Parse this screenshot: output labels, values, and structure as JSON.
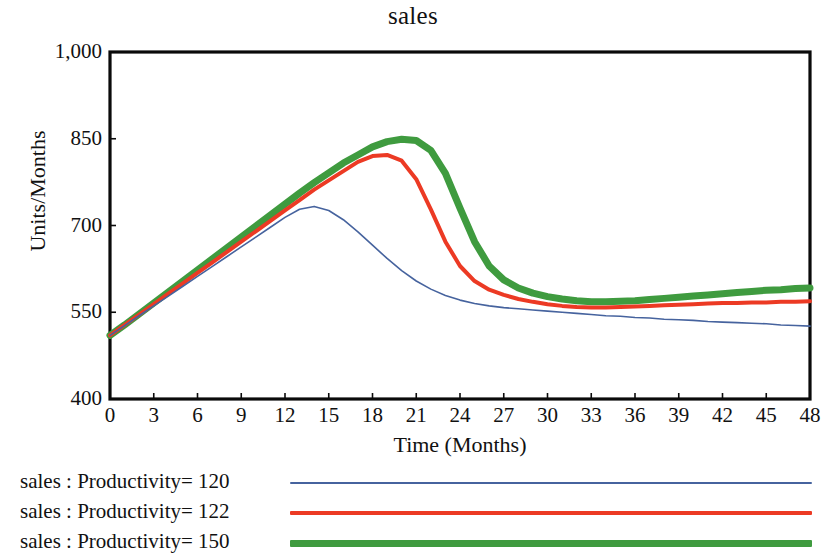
{
  "chart_data": {
    "type": "line",
    "title": "sales",
    "xlabel": "Time (Months)",
    "ylabel": "Units/Months",
    "xlim": [
      0,
      48
    ],
    "ylim": [
      400,
      1000
    ],
    "xticks": [
      0,
      3,
      6,
      9,
      12,
      15,
      18,
      21,
      24,
      27,
      30,
      33,
      36,
      39,
      42,
      45,
      48
    ],
    "xtick_labels": [
      "0",
      "3",
      "6",
      "9",
      "12",
      "15",
      "18",
      "21",
      "24",
      "27",
      "30",
      "33",
      "36",
      "39",
      "42",
      "45",
      "48"
    ],
    "yticks": [
      400,
      550,
      700,
      850,
      1000
    ],
    "ytick_labels": [
      "400",
      "550",
      "700",
      "850",
      "1,000"
    ],
    "grid": false,
    "legend_position": "below",
    "x": [
      0,
      1,
      2,
      3,
      4,
      5,
      6,
      7,
      8,
      9,
      10,
      11,
      12,
      13,
      14,
      15,
      16,
      17,
      18,
      19,
      20,
      21,
      22,
      23,
      24,
      25,
      26,
      27,
      28,
      29,
      30,
      31,
      32,
      33,
      34,
      35,
      36,
      37,
      38,
      39,
      40,
      41,
      42,
      43,
      44,
      45,
      46,
      47,
      48
    ],
    "series": [
      {
        "name": "sales : Productivity= 120",
        "color": "#46639e",
        "line_width": 1.6,
        "values": [
          510,
          527,
          544,
          561,
          578,
          595,
          612,
          629,
          646,
          663,
          680,
          697,
          714,
          728,
          733,
          726,
          710,
          689,
          666,
          643,
          622,
          604,
          590,
          579,
          571,
          565,
          561,
          558,
          556,
          554,
          552,
          550,
          548,
          546,
          544,
          543,
          541,
          540,
          538,
          537,
          536,
          534,
          533,
          532,
          531,
          530,
          528,
          527,
          526
        ]
      },
      {
        "name": "sales : Productivity= 122",
        "color": "#ec3a24",
        "line_width": 4.0,
        "values": [
          510,
          528,
          546,
          564,
          582,
          600,
          618,
          636,
          654,
          672,
          690,
          708,
          726,
          744,
          762,
          778,
          794,
          810,
          820,
          822,
          812,
          780,
          728,
          672,
          630,
          604,
          589,
          580,
          573,
          568,
          564,
          561,
          559,
          558,
          558,
          559,
          560,
          561,
          562,
          563,
          564,
          565,
          566,
          566,
          567,
          567,
          568,
          568,
          569
        ]
      },
      {
        "name": "sales : Productivity= 150",
        "color": "#3f9b3f",
        "line_width": 7.0,
        "values": [
          510,
          528,
          547,
          566,
          585,
          604,
          623,
          642,
          661,
          680,
          699,
          718,
          737,
          756,
          774,
          791,
          808,
          822,
          836,
          845,
          849,
          847,
          830,
          790,
          730,
          672,
          630,
          606,
          592,
          583,
          577,
          573,
          570,
          568,
          568,
          569,
          570,
          572,
          574,
          576,
          578,
          580,
          582,
          584,
          586,
          588,
          589,
          591,
          592
        ]
      }
    ]
  },
  "axes": {
    "frame_color": "#0a0a0a"
  }
}
